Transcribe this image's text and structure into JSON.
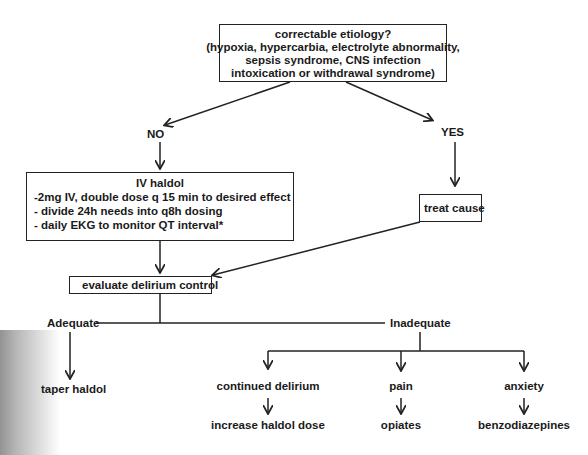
{
  "nodes": {
    "question": {
      "title": "correctable etiology?",
      "lines": [
        "(hypoxia, hypercarbia, electrolyte abnormality,",
        "sepsis syndrome, CNS infection",
        "intoxication or withdrawal syndrome)"
      ]
    },
    "no_label": "NO",
    "yes_label": "YES",
    "iv_haldol": {
      "title": "IV haldol",
      "lines": [
        "-2mg IV, double dose q 15 min to desired effect",
        "- divide 24h needs into q8h dosing",
        "- daily EKG to monitor QT interval*"
      ]
    },
    "treat_cause": "treat cause",
    "evaluate": "evaluate delirium control",
    "adequate": "Adequate",
    "inadequate": "Inadequate",
    "taper": "taper haldol",
    "branches": [
      {
        "condition": "continued delirium",
        "action": "increase haldol dose"
      },
      {
        "condition": "pain",
        "action": "opiates"
      },
      {
        "condition": "anxiety",
        "action": "benzodiazepines"
      }
    ]
  },
  "colors": {
    "line": "#222222",
    "background": "#ffffff"
  }
}
